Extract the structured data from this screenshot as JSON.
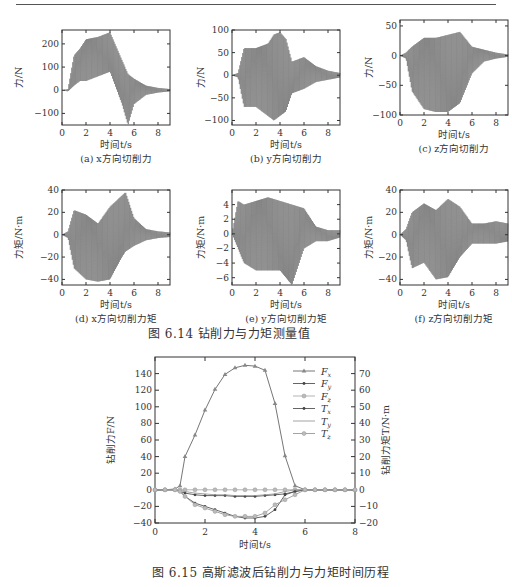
{
  "figure_6_14": {
    "caption": "图 6.14    钻削力与力矩测量值",
    "panels": [
      {
        "id": "a",
        "caption": "(a) x方向切削力",
        "ylabel": "力/N",
        "xlabel": "时间t/s",
        "yticks": [
          "200",
          "100",
          "0",
          "−100"
        ],
        "xticks": [
          "0",
          "2",
          "4",
          "6",
          "8"
        ],
        "ylim": [
          -150,
          260
        ]
      },
      {
        "id": "b",
        "caption": "(b) y方向切削力",
        "ylabel": "力/N",
        "xlabel": "时间t/s",
        "yticks": [
          "100",
          "50",
          "0",
          "−50",
          "−100"
        ],
        "xticks": [
          "0",
          "2",
          "4",
          "6",
          "8"
        ],
        "ylim": [
          -110,
          100
        ]
      },
      {
        "id": "c",
        "caption": "(c) z方向切削力",
        "ylabel": "力/N",
        "xlabel": "时间t/s",
        "yticks": [
          "50",
          "0",
          "−50",
          "−100"
        ],
        "xticks": [
          "0",
          "2",
          "4",
          "6",
          "8"
        ],
        "ylim": [
          -100,
          60
        ]
      },
      {
        "id": "d",
        "caption": "(d) x方向切削力矩",
        "ylabel": "力矩/N·m",
        "xlabel": "时间t/s",
        "yticks": [
          "40",
          "20",
          "0",
          "−20",
          "−40"
        ],
        "xticks": [
          "0",
          "2",
          "4",
          "6",
          "8"
        ],
        "ylim": [
          -45,
          40
        ]
      },
      {
        "id": "e",
        "caption": "(e) y方向切削力矩",
        "ylabel": "力矩/N·m",
        "xlabel": "时间t/s",
        "yticks": [
          "4",
          "2",
          "0",
          "−2",
          "−4",
          "−6"
        ],
        "xticks": [
          "0",
          "2",
          "4",
          "6",
          "8"
        ],
        "ylim": [
          -7,
          6
        ]
      },
      {
        "id": "f",
        "caption": "(f) z方向切削力矩",
        "ylabel": "力矩/N·m",
        "xlabel": "时间t/s",
        "yticks": [
          "40",
          "20",
          "0",
          "−20",
          "−40"
        ],
        "xticks": [
          "0",
          "2",
          "4",
          "6",
          "8"
        ],
        "ylim": [
          -45,
          40
        ]
      }
    ]
  },
  "figure_6_15": {
    "caption": "图 6.15    高斯滤波后钻削力与力矩时间历程",
    "ylabel_left": "钻削力F/N",
    "ylabel_right": "钻削力矩T/N·m",
    "xlabel": "时间t/s",
    "legend": [
      "Fx",
      "Fy",
      "Fz",
      "Tx",
      "Ty",
      "Tz"
    ]
  },
  "chart_data": [
    {
      "type": "line",
      "title": "(a) x方向切削力",
      "xlabel": "时间t/s",
      "ylabel": "力/N",
      "xlim": [
        0,
        9
      ],
      "ylim": [
        -150,
        260
      ],
      "series": [
        {
          "name": "Fx envelope max",
          "x": [
            0,
            0.5,
            1,
            1.5,
            2,
            3,
            4,
            5,
            5.5,
            6,
            7,
            8,
            9
          ],
          "values": [
            0,
            5,
            150,
            180,
            220,
            230,
            250,
            130,
            70,
            50,
            20,
            10,
            5
          ]
        },
        {
          "name": "Fx envelope min",
          "x": [
            0,
            0.5,
            1,
            1.5,
            2,
            3,
            4,
            5,
            5.5,
            6,
            7,
            8,
            9
          ],
          "values": [
            0,
            -5,
            20,
            40,
            40,
            60,
            80,
            -60,
            -150,
            -60,
            -20,
            -10,
            -5
          ]
        }
      ]
    },
    {
      "type": "line",
      "title": "(b) y方向切削力",
      "xlabel": "时间t/s",
      "ylabel": "力/N",
      "xlim": [
        0,
        9
      ],
      "ylim": [
        -110,
        100
      ],
      "series": [
        {
          "name": "Fy envelope max",
          "x": [
            0,
            0.5,
            1,
            2,
            3,
            3.5,
            4,
            4.5,
            5,
            6,
            7,
            8,
            9
          ],
          "values": [
            0,
            5,
            60,
            60,
            70,
            90,
            95,
            80,
            30,
            40,
            20,
            10,
            5
          ]
        },
        {
          "name": "Fy envelope min",
          "x": [
            0,
            0.5,
            1,
            2,
            3,
            3.5,
            4,
            4.5,
            5,
            6,
            7,
            8,
            9
          ],
          "values": [
            0,
            -5,
            -70,
            -70,
            -90,
            -100,
            -90,
            -80,
            -40,
            -30,
            -15,
            -10,
            -5
          ]
        }
      ]
    },
    {
      "type": "line",
      "title": "(c) z方向切削力",
      "xlabel": "时间t/s",
      "ylabel": "力/N",
      "xlim": [
        0,
        9
      ],
      "ylim": [
        -100,
        60
      ],
      "series": [
        {
          "name": "Fz envelope max",
          "x": [
            0,
            0.5,
            1,
            2,
            3,
            4,
            5,
            6,
            7,
            8,
            9
          ],
          "values": [
            0,
            5,
            15,
            30,
            30,
            35,
            40,
            15,
            10,
            5,
            2
          ]
        },
        {
          "name": "Fz envelope min",
          "x": [
            0,
            0.5,
            1,
            2,
            3,
            4,
            5,
            6,
            7,
            8,
            9
          ],
          "values": [
            0,
            -5,
            -60,
            -90,
            -95,
            -95,
            -80,
            -30,
            -10,
            -5,
            -2
          ]
        }
      ]
    },
    {
      "type": "line",
      "title": "(d) x方向切削力矩",
      "xlabel": "时间t/s",
      "ylabel": "力矩/N·m",
      "xlim": [
        0,
        9
      ],
      "ylim": [
        -45,
        40
      ],
      "series": [
        {
          "name": "Tx envelope max",
          "x": [
            0,
            0.5,
            1,
            2,
            3,
            4,
            5,
            5.3,
            6,
            7,
            8,
            9
          ],
          "values": [
            0,
            3,
            22,
            18,
            10,
            25,
            35,
            38,
            15,
            5,
            3,
            2
          ]
        },
        {
          "name": "Tx envelope min",
          "x": [
            0,
            0.5,
            1,
            2,
            3,
            4,
            5,
            5.3,
            6,
            7,
            8,
            9
          ],
          "values": [
            0,
            -3,
            -30,
            -40,
            -42,
            -40,
            -20,
            -15,
            -10,
            -5,
            -3,
            -2
          ]
        }
      ]
    },
    {
      "type": "line",
      "title": "(e) y方向切削力矩",
      "xlabel": "时间t/s",
      "ylabel": "力矩/N·m",
      "xlim": [
        0,
        9
      ],
      "ylim": [
        -7,
        6
      ],
      "series": [
        {
          "name": "Ty envelope max",
          "x": [
            0,
            0.5,
            1,
            2,
            3,
            4,
            5,
            6,
            7,
            8,
            9
          ],
          "values": [
            0,
            4.5,
            4,
            4.5,
            5,
            4.5,
            4,
            3.5,
            1,
            0.5,
            0.5
          ]
        },
        {
          "name": "Ty envelope min",
          "x": [
            0,
            0.5,
            1,
            2,
            3,
            4,
            5,
            6,
            7,
            8,
            9
          ],
          "values": [
            0,
            -2,
            -4,
            -5,
            -5,
            -5,
            -7,
            -2,
            -1,
            -1,
            -0.5
          ]
        }
      ]
    },
    {
      "type": "line",
      "title": "(f) z方向切削力矩",
      "xlabel": "时间t/s",
      "ylabel": "力矩/N·m",
      "xlim": [
        0,
        9
      ],
      "ylim": [
        -45,
        40
      ],
      "series": [
        {
          "name": "Tz envelope max",
          "x": [
            0,
            0.5,
            1,
            2,
            3,
            4,
            5,
            6,
            7,
            8,
            9
          ],
          "values": [
            0,
            5,
            20,
            28,
            22,
            32,
            25,
            10,
            10,
            12,
            10
          ]
        },
        {
          "name": "Tz envelope min",
          "x": [
            0,
            0.5,
            1,
            2,
            3,
            4,
            5,
            6,
            7,
            8,
            9
          ],
          "values": [
            0,
            -5,
            -30,
            -25,
            -40,
            -38,
            -20,
            -8,
            -8,
            -8,
            -6
          ]
        }
      ]
    },
    {
      "type": "line",
      "title": "图 6.15 高斯滤波后钻削力与力矩时间历程",
      "xlabel": "时间t/s",
      "ylabel": "钻削力F/N",
      "ylabel_right": "钻削力矩T/N·m",
      "xlim": [
        0,
        8
      ],
      "ylim": [
        -40,
        160
      ],
      "ylim_right": [
        -20,
        80
      ],
      "xticks": [
        0,
        2,
        4,
        6,
        8
      ],
      "yticks": [
        -40,
        -20,
        0,
        20,
        40,
        60,
        80,
        100,
        120,
        140
      ],
      "yticks_right": [
        -20,
        -10,
        0,
        10,
        20,
        30,
        40,
        50,
        60,
        70
      ],
      "legend_position": "upper right",
      "x": [
        0,
        0.4,
        0.8,
        1,
        1.2,
        1.6,
        2,
        2.4,
        2.8,
        3.2,
        3.6,
        4,
        4.4,
        4.8,
        5.2,
        5.6,
        6,
        6.4,
        6.8,
        7.2,
        7.6,
        8
      ],
      "series": [
        {
          "name": "Fx",
          "axis": "left",
          "values": [
            0,
            0,
            1,
            5,
            40,
            66,
            96,
            121,
            139,
            147,
            150,
            149,
            144,
            104,
            41,
            5,
            0,
            0,
            0,
            0,
            0,
            0
          ]
        },
        {
          "name": "Fy",
          "axis": "left",
          "values": [
            0,
            0,
            0,
            -2,
            -4,
            -6,
            -7,
            -7,
            -7,
            -8,
            -8,
            -8,
            -7,
            -6,
            -5,
            -2,
            0,
            0,
            0,
            0,
            0,
            0
          ]
        },
        {
          "name": "Fz",
          "axis": "left",
          "values": [
            0,
            0,
            0,
            0,
            0,
            0,
            0,
            0,
            0,
            0,
            0,
            0,
            0,
            0,
            0,
            0,
            0,
            0,
            0,
            0,
            0,
            0
          ]
        },
        {
          "name": "Tx",
          "axis": "right",
          "values": [
            0,
            0,
            0,
            -1,
            -4,
            -8,
            -10,
            -12,
            -14,
            -16,
            -17,
            -17,
            -16,
            -12,
            -3,
            -1,
            0,
            0,
            0,
            0,
            0,
            0
          ]
        },
        {
          "name": "Ty",
          "axis": "right",
          "values": [
            0,
            0,
            0,
            -0.5,
            -1,
            -2,
            -2.5,
            -3,
            -3,
            -3.5,
            -3.5,
            -3.5,
            -3,
            -2.5,
            -1,
            0,
            0,
            0,
            0,
            0,
            0,
            0
          ]
        },
        {
          "name": "Tz",
          "axis": "right",
          "values": [
            0,
            0,
            0,
            -1,
            -4,
            -9,
            -11,
            -13,
            -15,
            -16,
            -16,
            -16,
            -14,
            -9,
            -6,
            -3,
            0,
            0,
            0,
            0,
            0,
            0
          ]
        }
      ]
    }
  ]
}
